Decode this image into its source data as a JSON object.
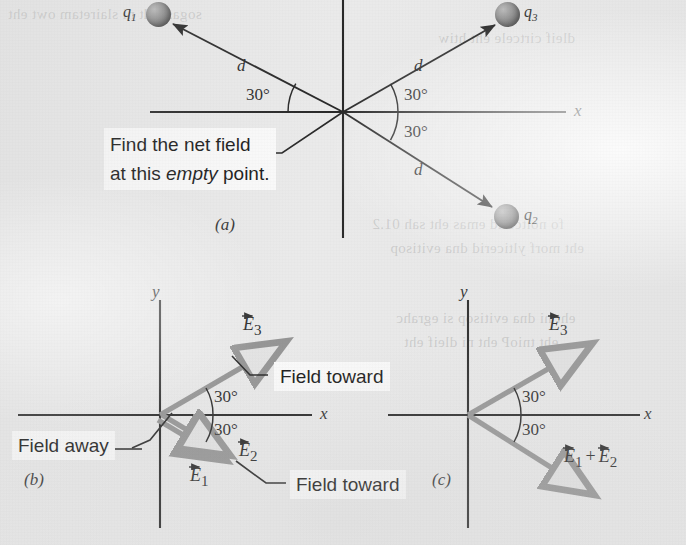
{
  "figure": {
    "background_color": "#e9e9e9",
    "ink_color": "#111111",
    "vector_color": "#8a8a8a",
    "sphere_color": "#6a6a6a"
  },
  "panel_a": {
    "label": "(a)",
    "x_axis_label": "x",
    "charges": [
      {
        "name": "q1",
        "label_html": "q",
        "sub": "1"
      },
      {
        "name": "q2",
        "label_html": "q",
        "sub": "2"
      },
      {
        "name": "q3",
        "label_html": "q",
        "sub": "3"
      }
    ],
    "distance_labels": [
      "d",
      "d",
      "d"
    ],
    "angle_labels": [
      "30°",
      "30°",
      "30°"
    ],
    "callout_line1": "Find the net field",
    "callout_line2_pre": "at this ",
    "callout_line2_em": "empty",
    "callout_line2_post": " point."
  },
  "panel_b": {
    "label": "(b)",
    "x_axis_label": "x",
    "y_axis_label": "y",
    "angle_labels": [
      "30°",
      "30°"
    ],
    "vectors": [
      {
        "name": "E3",
        "base": "E",
        "sub": "3"
      },
      {
        "name": "E1",
        "base": "E",
        "sub": "1"
      },
      {
        "name": "E2",
        "base": "E",
        "sub": "2"
      }
    ],
    "callout_field_toward_top": "Field toward",
    "callout_field_toward_bottom": "Field toward",
    "callout_field_away": "Field away"
  },
  "panel_c": {
    "label": "(c)",
    "x_axis_label": "x",
    "y_axis_label": "y",
    "angle_labels": [
      "30°",
      "30°"
    ],
    "vectors": [
      {
        "name": "E3",
        "base": "E",
        "sub": "3"
      },
      {
        "name": "E1_plus_E2_first",
        "base": "E",
        "sub": "1"
      },
      {
        "name": "E1_plus_E2_second",
        "base": "E",
        "sub": "2"
      }
    ],
    "plus_sign": "+"
  },
  "ghost_text": {
    "lines": [
      "sogas sidt ni slairetam owt eht",
      "dleif cirtcele eht htiw",
      "fo noitcerid emas eht sah 01.2",
      "eht morf ylticerid dna evitisop",
      "eht ni dna evitisop si egrahc",
      "eht tnioP eht ni dleif eht"
    ]
  }
}
